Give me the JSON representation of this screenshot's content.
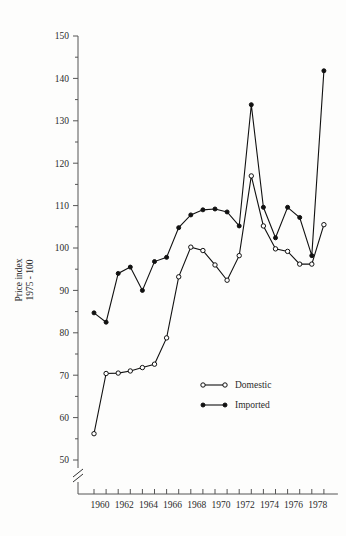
{
  "chart_data": {
    "type": "line",
    "title": "",
    "xlabel": "",
    "ylabel": "Price index 1975 - 100",
    "ylabel_line1": "Price index",
    "ylabel_line2": "1975 - 100",
    "xlim": [
      1959.5,
      1979.5
    ],
    "ylim": [
      50,
      150
    ],
    "y_ticks_major": [
      50,
      60,
      70,
      80,
      90,
      100,
      110,
      120,
      130,
      140,
      150
    ],
    "y_ticks_minor": [
      55,
      65,
      75,
      85,
      95,
      105,
      115,
      125,
      135,
      145
    ],
    "y_tick_labels": [
      "50",
      "60",
      "70",
      "80",
      "90",
      "100",
      "110",
      "120",
      "130",
      "140",
      "150"
    ],
    "x": [
      1960,
      1961,
      1962,
      1963,
      1964,
      1965,
      1966,
      1967,
      1968,
      1969,
      1970,
      1971,
      1972,
      1973,
      1974,
      1975,
      1976,
      1977,
      1978,
      1979
    ],
    "x_ticks": [
      1960,
      1961,
      1962,
      1963,
      1964,
      1965,
      1966,
      1967,
      1968,
      1969,
      1970,
      1971,
      1972,
      1973,
      1974,
      1975,
      1976,
      1977,
      1978,
      1979
    ],
    "x_tick_labels": [
      {
        "value": 1960,
        "label": "1960"
      },
      {
        "value": 1962,
        "label": "1962"
      },
      {
        "value": 1964,
        "label": "1964"
      },
      {
        "value": 1966,
        "label": "1966"
      },
      {
        "value": 1968,
        "label": "1968"
      },
      {
        "value": 1970,
        "label": "1970"
      },
      {
        "value": 1972,
        "label": "1972"
      },
      {
        "value": 1974,
        "label": "1974"
      },
      {
        "value": 1976,
        "label": "1976"
      },
      {
        "value": 1978,
        "label": "1978"
      }
    ],
    "axis_break": true,
    "grid": false,
    "legend_position": "inside-lower-right",
    "series": [
      {
        "name": "Domestic",
        "marker": "open-circle",
        "color": "#111111",
        "values": [
          56.2,
          70.4,
          70.5,
          71.0,
          71.8,
          72.6,
          78.8,
          93.2,
          100.2,
          99.4,
          96.0,
          92.4,
          98.2,
          117.0,
          105.2,
          99.8,
          99.2,
          96.2,
          96.2,
          105.5
        ]
      },
      {
        "name": "Imported",
        "marker": "filled-circle",
        "color": "#111111",
        "values": [
          84.7,
          82.5,
          94.0,
          95.5,
          90.0,
          96.8,
          97.8,
          104.8,
          107.8,
          109.0,
          109.2,
          108.5,
          105.2,
          133.8,
          109.6,
          102.4,
          109.6,
          107.2,
          98.2,
          141.8
        ]
      }
    ],
    "legend": [
      {
        "label": "Domestic",
        "marker": "open-circle"
      },
      {
        "label": "Imported",
        "marker": "filled-circle"
      }
    ]
  }
}
